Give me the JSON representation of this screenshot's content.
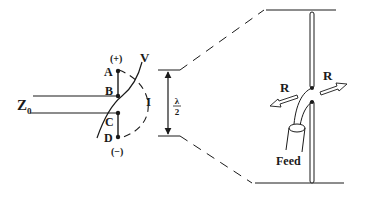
{
  "diagram": {
    "feedline": {
      "impedance_label": "Z",
      "impedance_subscript": "0"
    },
    "points": {
      "A": "A",
      "B": "B",
      "C": "C",
      "D": "D",
      "plus": "(+)",
      "minus": "(−)"
    },
    "waves": {
      "voltage": "V",
      "current": "I"
    },
    "dimension": {
      "numerator": "λ",
      "denominator": "2"
    },
    "dipole": {
      "radiation_left": "R",
      "radiation_right": "R",
      "feed_label": "Feed"
    },
    "colors": {
      "ink": "#1a1a1a",
      "background": "#ffffff"
    }
  }
}
